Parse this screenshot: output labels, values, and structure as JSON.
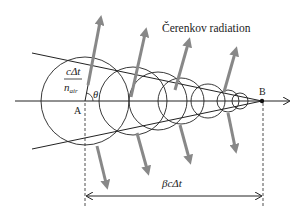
{
  "diagram": {
    "title_label": "Čerenkov radiation",
    "point_a_label": "A",
    "point_b_label": "B",
    "angle_label": "θ",
    "radius_label_numerator": "cΔt",
    "radius_label_denominator": "n",
    "radius_label_subscript": "air",
    "distance_label": "βcΔt",
    "colors": {
      "line": "#222222",
      "arrow": "#888888",
      "background": "#ffffff"
    }
  }
}
